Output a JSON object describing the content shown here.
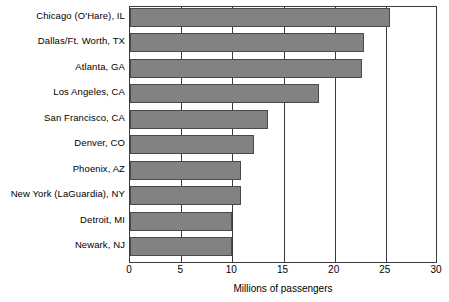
{
  "chart_data": {
    "type": "bar",
    "orientation": "horizontal",
    "title": "",
    "xlabel": "Millions of passengers",
    "ylabel": "",
    "xlim": [
      0,
      30
    ],
    "xticks": [
      0,
      5,
      10,
      15,
      20,
      25,
      30
    ],
    "xtick_labels": [
      "0",
      "5",
      "10",
      "15",
      "20",
      "25",
      "30"
    ],
    "grid": true,
    "grid_axis": "x",
    "legend": false,
    "categories": [
      "Chicago (O'Hare), IL",
      "Dallas/Ft. Worth, TX",
      "Atlanta, GA",
      "Los Angeles, CA",
      "San Francisco, CA",
      "Denver, CO",
      "Phoenix, AZ",
      "New York (LaGuardia), NY",
      "Detroit, MI",
      "Newark, NJ"
    ],
    "values": [
      25.4,
      22.9,
      22.7,
      18.5,
      13.5,
      12.1,
      10.8,
      10.8,
      10.0,
      10.0
    ],
    "bar_fill_color": "#828282",
    "bar_edge_color": "#4a4a4a",
    "axis_color": "#3c3c3c",
    "background_color": "#ffffff"
  }
}
